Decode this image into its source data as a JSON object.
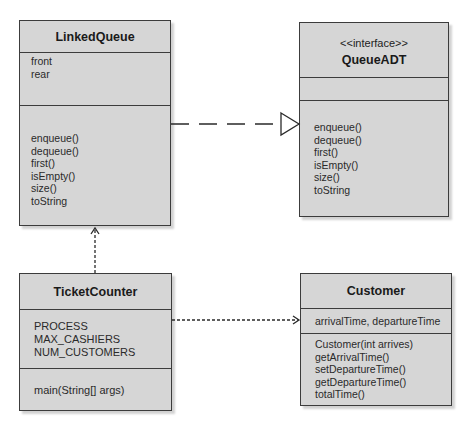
{
  "diagram": {
    "type": "UML class diagram",
    "colors": {
      "class_fill": "#d6d6d6",
      "border": "#3c3c3c",
      "text": "#1e1e1e",
      "connector": "#2a2a2a"
    }
  },
  "classes": {
    "linked_queue": {
      "name": "LinkedQueue",
      "attributes": [
        "front",
        "rear"
      ],
      "methods": [
        "enqueue()",
        "dequeue()",
        "first()",
        "isEmpty()",
        "size()",
        "toString"
      ]
    },
    "queue_adt": {
      "stereotype": "<<interface>>",
      "name": "QueueADT",
      "attributes": [],
      "methods": [
        "enqueue()",
        "dequeue()",
        "first()",
        "isEmpty()",
        "size()",
        "toString"
      ]
    },
    "ticket_counter": {
      "name": "TicketCounter",
      "attributes": [
        "PROCESS",
        "MAX_CASHIERS",
        "NUM_CUSTOMERS"
      ],
      "methods": [
        "main(String[] args)"
      ]
    },
    "customer": {
      "name": "Customer",
      "attributes": [
        "arrivalTime, departureTime"
      ],
      "methods": [
        "Customer(int arrives)",
        "getArrivalTime()",
        "setDepartureTime()",
        "getDepartureTime()",
        "totalTime()"
      ]
    }
  },
  "relationships": [
    {
      "from": "LinkedQueue",
      "to": "QueueADT",
      "kind": "realization",
      "style": "dashed line with hollow triangle"
    },
    {
      "from": "TicketCounter",
      "to": "LinkedQueue",
      "kind": "dependency",
      "style": "dotted line with open arrow"
    },
    {
      "from": "TicketCounter",
      "to": "Customer",
      "kind": "dependency",
      "style": "dotted line with open arrow"
    }
  ]
}
